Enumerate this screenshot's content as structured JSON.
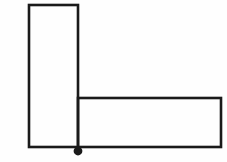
{
  "canvas": {
    "width": 227,
    "height": 162,
    "background_color": "#fefefe",
    "description": "L-shaped angle bracket outline drawing with a filled dot marker at the bottom inner corner"
  },
  "figure": {
    "name": "l-shaped-bracket",
    "stroke_color": "#1a1a1a",
    "fill_color": "none",
    "stroke_width": 2.6,
    "vertical_arm": {
      "label": "vertical-arm",
      "x": 29,
      "y": 5,
      "width": 49,
      "height": 142
    },
    "horizontal_arm": {
      "label": "horizontal-arm",
      "x": 78,
      "y": 98,
      "width": 143,
      "height": 49
    },
    "outline_points": "29,5 78,5 78,98 221,98 221,147 29,147",
    "inner_corner": {
      "x": 78,
      "y": 98
    }
  },
  "marker": {
    "name": "pivot-dot",
    "shape": "circle",
    "cx": 78,
    "cy": 151,
    "radius": 4.4,
    "color": "#1a1a1a"
  },
  "chart_data": {
    "type": "diagram",
    "title": "",
    "shapes": [
      {
        "name": "vertical-arm",
        "type": "rectangle",
        "x": 29,
        "y": 5,
        "width": 49,
        "height": 142
      },
      {
        "name": "horizontal-arm",
        "type": "rectangle",
        "x": 78,
        "y": 98,
        "width": 143,
        "height": 49
      },
      {
        "name": "pivot-dot",
        "type": "circle",
        "cx": 78,
        "cy": 151,
        "r": 4.4,
        "filled": true
      }
    ],
    "labels": [],
    "annotations": []
  }
}
